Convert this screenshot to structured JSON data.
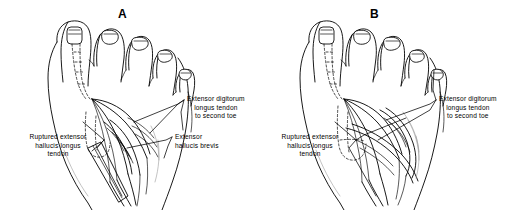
{
  "figure": {
    "caption_letters": [
      "A",
      "B"
    ],
    "background_color": "#ffffff",
    "ink_color": "#000000"
  },
  "panels": [
    {
      "id": "A",
      "letter": "A",
      "labels": [
        {
          "name": "extensor-digitorum-longus-label",
          "lines": [
            "Extensor digitorum",
            "longus tendon",
            "to second toe"
          ],
          "align": "center"
        },
        {
          "name": "extensor-hallucis-brevis-label",
          "lines": [
            "Extensor",
            "hallucis brevis"
          ],
          "align": "left"
        },
        {
          "name": "ruptured-extensor-hallucis-longus-label",
          "lines": [
            "Ruptured extensor",
            "hallucis longus",
            "tendon"
          ],
          "align": "center"
        }
      ]
    },
    {
      "id": "B",
      "letter": "B",
      "labels": [
        {
          "name": "extensor-digitorum-longus-label",
          "lines": [
            "Extensor digitorum",
            "longus tendon",
            "to second toe"
          ],
          "align": "center"
        },
        {
          "name": "ruptured-extensor-hallucis-longus-label",
          "lines": [
            "Ruptured extensor",
            "hallucis longus",
            "tendon"
          ],
          "align": "center"
        }
      ]
    }
  ],
  "text": {
    "a_letter": "A",
    "b_letter": "B",
    "edl_line1": "Extensor digitorum",
    "edl_line2": "longus tendon",
    "edl_line3": "to second toe",
    "ehb_line1": "Extensor",
    "ehb_line2": "hallucis brevis",
    "rup_line1": "Ruptured extensor",
    "rup_line2": "hallucis longus",
    "rup_line3": "tendon",
    "b_edl_line1": "Extensor digitorum",
    "b_edl_line2": "longus tendon",
    "b_edl_line3": "to second toe",
    "b_rup_line1": "Ruptured extensor",
    "b_rup_line2": "hallucis longus",
    "b_rup_line3": "tendon"
  }
}
